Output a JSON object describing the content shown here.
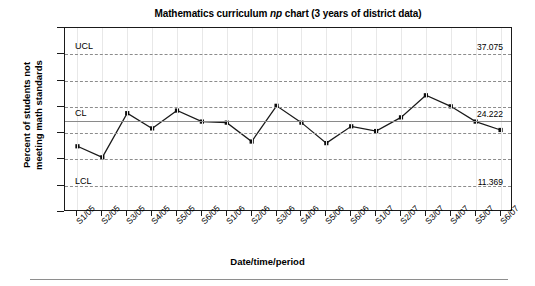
{
  "chart_data": {
    "type": "line",
    "title_prefix": "Mathematics curriculum ",
    "title_italic": "np",
    "title_suffix": " chart (3 years of district data)",
    "title": "Mathematics curriculum np chart (3 years of district data)",
    "xlabel": "Date/time/period",
    "ylabel_line1": "Percent of students not",
    "ylabel_line2": "meeting math standards",
    "ylabel": "Percent of students not meeting math standards",
    "ylim": [
      7,
      42
    ],
    "yticks": [
      42,
      37,
      32,
      27,
      22,
      17,
      12,
      7
    ],
    "grid": "horizontal-dashed",
    "legend": "none",
    "categories": [
      "S1/05",
      "S2/05",
      "S3/05",
      "S4/05",
      "S5/05",
      "S6/05",
      "S1/06",
      "S2/06",
      "S3/06",
      "S4/06",
      "S5/06",
      "S6/06",
      "S1/07",
      "S2/07",
      "S3/07",
      "S4/07",
      "S5/07",
      "S6/07"
    ],
    "values": [
      19.5,
      17.4,
      25.8,
      22.9,
      26.3,
      24.2,
      24.0,
      20.4,
      27.2,
      24.0,
      20.1,
      23.3,
      22.4,
      25.0,
      29.2,
      27.1,
      24.2,
      22.6
    ],
    "control_limits": {
      "ucl_label": "UCL",
      "ucl_value": 37.075,
      "ucl_value_text": "37.075",
      "cl_label": "CL",
      "cl_value": 24.222,
      "cl_value_text": "24.222",
      "lcl_label": "LCL",
      "lcl_value": 11.369,
      "lcl_value_text": "11.369"
    }
  }
}
